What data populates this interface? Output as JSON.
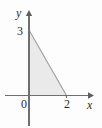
{
  "figure": {
    "kind": "coordinate-plane-shaded-region",
    "background_color": "#fdfdfd"
  },
  "axes": {
    "x": {
      "label": "x",
      "label_style": "italic",
      "arrow": "right-arrowhead",
      "color": "#6f6f6f"
    },
    "y": {
      "label": "y",
      "label_style": "italic",
      "arrow": "up-arrowhead",
      "color": "#6f6f6f"
    },
    "origin_label": "0"
  },
  "ticks": {
    "x": [
      {
        "value": 2,
        "label": "2"
      }
    ],
    "y": [
      {
        "value": 3,
        "label": "3"
      }
    ]
  },
  "chart_data": {
    "type": "area",
    "title": "",
    "subtitle": "",
    "xlabel": "x",
    "ylabel": "y",
    "xlim": [
      -0.5,
      3.4
    ],
    "ylim": [
      -0.9,
      3.9
    ],
    "grid": false,
    "legend": null,
    "origin_label": "0",
    "xticks": [
      0,
      2
    ],
    "xticklabels": [
      "0",
      "2"
    ],
    "yticks": [
      3
    ],
    "yticklabels": [
      "3"
    ],
    "annotations": [],
    "series": [
      {
        "name": "shaded-triangle-region",
        "shape": "triangle",
        "fill_color": "#eaeaea",
        "edge_color": "#9d9d9d",
        "vertices": [
          {
            "x": 0,
            "y": 0
          },
          {
            "x": 0,
            "y": 3
          },
          {
            "x": 2,
            "y": 0
          }
        ],
        "boundary_line": {
          "description": "hypotenuse from (0,3) to (2,0)",
          "equation": "y = 3 - 1.5x",
          "x_intercept": 2,
          "y_intercept": 3,
          "slope": -1.5
        },
        "area": 3
      }
    ]
  }
}
